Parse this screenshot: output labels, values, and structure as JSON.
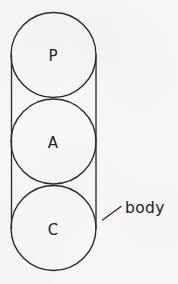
{
  "diagram": {
    "title": "body",
    "background_color": "#f8f8f7",
    "stroke_color": "#2b2b2b",
    "text_color": "#232323",
    "canvas": {
      "width": 178,
      "height": 284
    },
    "circles": [
      {
        "id": "circle-p",
        "label": "P",
        "center_x": 53.5,
        "center_y": 55,
        "radius": 42.5,
        "label_x": 53,
        "label_y": 61
      },
      {
        "id": "circle-a",
        "label": "A",
        "center_x": 53.5,
        "center_y": 141.5,
        "radius": 42.5,
        "label_x": 53,
        "label_y": 148
      },
      {
        "id": "circle-c",
        "label": "C",
        "center_x": 53.5,
        "center_y": 228,
        "radius": 42.5,
        "label_x": 53,
        "label_y": 235
      }
    ],
    "body_outline": {
      "name": "body",
      "left_line": {
        "x1": 11.5,
        "y1": 55,
        "x2": 11.5,
        "y2": 228
      },
      "right_line": {
        "x1": 96,
        "y1": 55,
        "x2": 96,
        "y2": 228
      }
    },
    "callout": {
      "label": "body",
      "leader_line": {
        "x1": 102.5,
        "y1": 220,
        "x2": 121,
        "y2": 206.5
      },
      "text_x": 125,
      "text_y": 213
    }
  }
}
